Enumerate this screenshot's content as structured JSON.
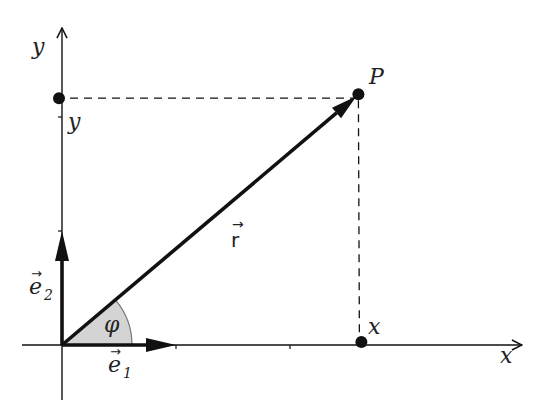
{
  "diagram": {
    "type": "cartesian-position-vector",
    "colors": {
      "ink": "#111111",
      "angle_fill": "#d4d4d4",
      "angle_stroke": "#777777",
      "background": "#ffffff"
    },
    "axes": {
      "x_label": "x",
      "y_label": "y",
      "x_ticks": [
        1,
        2
      ],
      "y_ticks": [
        1,
        2
      ]
    },
    "point": {
      "label": "P",
      "x": 2.6,
      "y": 2.2
    },
    "projections": {
      "x_label": "x",
      "y_label": "y"
    },
    "vectors": {
      "position": {
        "label": "r",
        "arrow": "→"
      },
      "e1": {
        "label": "e",
        "subscript": "1",
        "arrow": "→"
      },
      "e2": {
        "label": "e",
        "subscript": "2",
        "arrow": "→"
      }
    },
    "angle": {
      "label": "φ"
    }
  }
}
